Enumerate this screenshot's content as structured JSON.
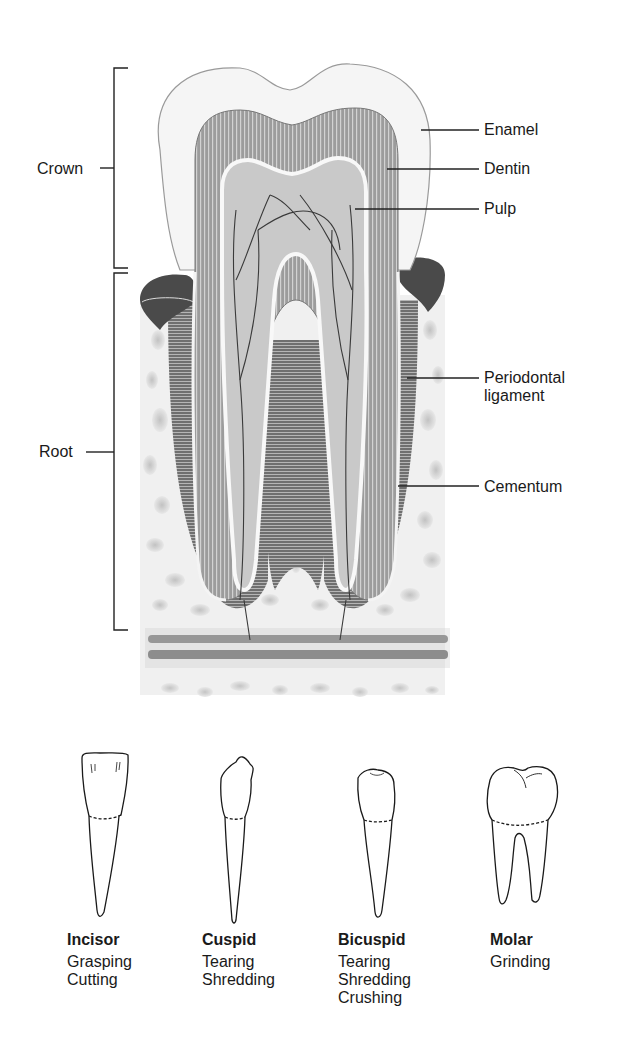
{
  "figure": {
    "regions": [
      {
        "id": "crown",
        "label": "Crown"
      },
      {
        "id": "root",
        "label": "Root"
      }
    ],
    "structures": [
      {
        "id": "enamel",
        "label": "Enamel"
      },
      {
        "id": "dentin",
        "label": "Dentin"
      },
      {
        "id": "pulp",
        "label": "Pulp"
      },
      {
        "id": "periodontal",
        "label_line1": "Periodontal",
        "label_line2": "ligament"
      },
      {
        "id": "cementum",
        "label": "Cementum"
      }
    ]
  },
  "tooth_types": [
    {
      "name": "Incisor",
      "functions": [
        "Grasping",
        "Cutting"
      ]
    },
    {
      "name": "Cuspid",
      "functions": [
        "Tearing",
        "Shredding"
      ]
    },
    {
      "name": "Bicuspid",
      "functions": [
        "Tearing",
        "Shredding",
        "Crushing"
      ]
    },
    {
      "name": "Molar",
      "functions": [
        "Grinding"
      ]
    }
  ],
  "colors": {
    "enamel": "#f2f2f2",
    "dentin": "#9a9a9a",
    "pulp": "#c8c8c8",
    "gum": "#5a5a5a",
    "bone": "#e6e6e6",
    "line": "#222222"
  }
}
